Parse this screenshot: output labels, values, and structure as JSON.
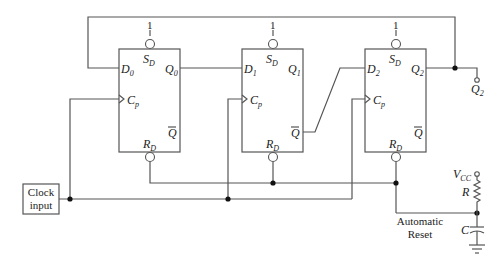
{
  "diagram": {
    "type": "circuit",
    "flip_flops": [
      {
        "id": "FF0",
        "d_label": "D",
        "d_sub": "0",
        "q_label": "Q",
        "q_sub": "0",
        "clk_label": "C",
        "clk_sub": "p",
        "set_label": "S",
        "set_sub": "D",
        "reset_label": "R",
        "reset_sub": "D",
        "qbar_label": "Q",
        "set_value": "1"
      },
      {
        "id": "FF1",
        "d_label": "D",
        "d_sub": "1",
        "q_label": "Q",
        "q_sub": "1",
        "clk_label": "C",
        "clk_sub": "p",
        "set_label": "S",
        "set_sub": "D",
        "reset_label": "R",
        "reset_sub": "D",
        "qbar_label": "Q",
        "set_value": "1"
      },
      {
        "id": "FF2",
        "d_label": "D",
        "d_sub": "2",
        "q_label": "Q",
        "q_sub": "2",
        "clk_label": "C",
        "clk_sub": "p",
        "set_label": "S",
        "set_sub": "D",
        "reset_label": "R",
        "reset_sub": "D",
        "qbar_label": "Q",
        "set_value": "1"
      }
    ],
    "clock": {
      "line1": "Clock",
      "line2": "input"
    },
    "output": {
      "label": "Q",
      "sub": "2"
    },
    "reset_circuit": {
      "vcc_label": "V",
      "vcc_sub": "CC",
      "resistor_label": "R",
      "capacitor_label": "C",
      "caption_line1": "Automatic",
      "caption_line2": "Reset"
    }
  }
}
